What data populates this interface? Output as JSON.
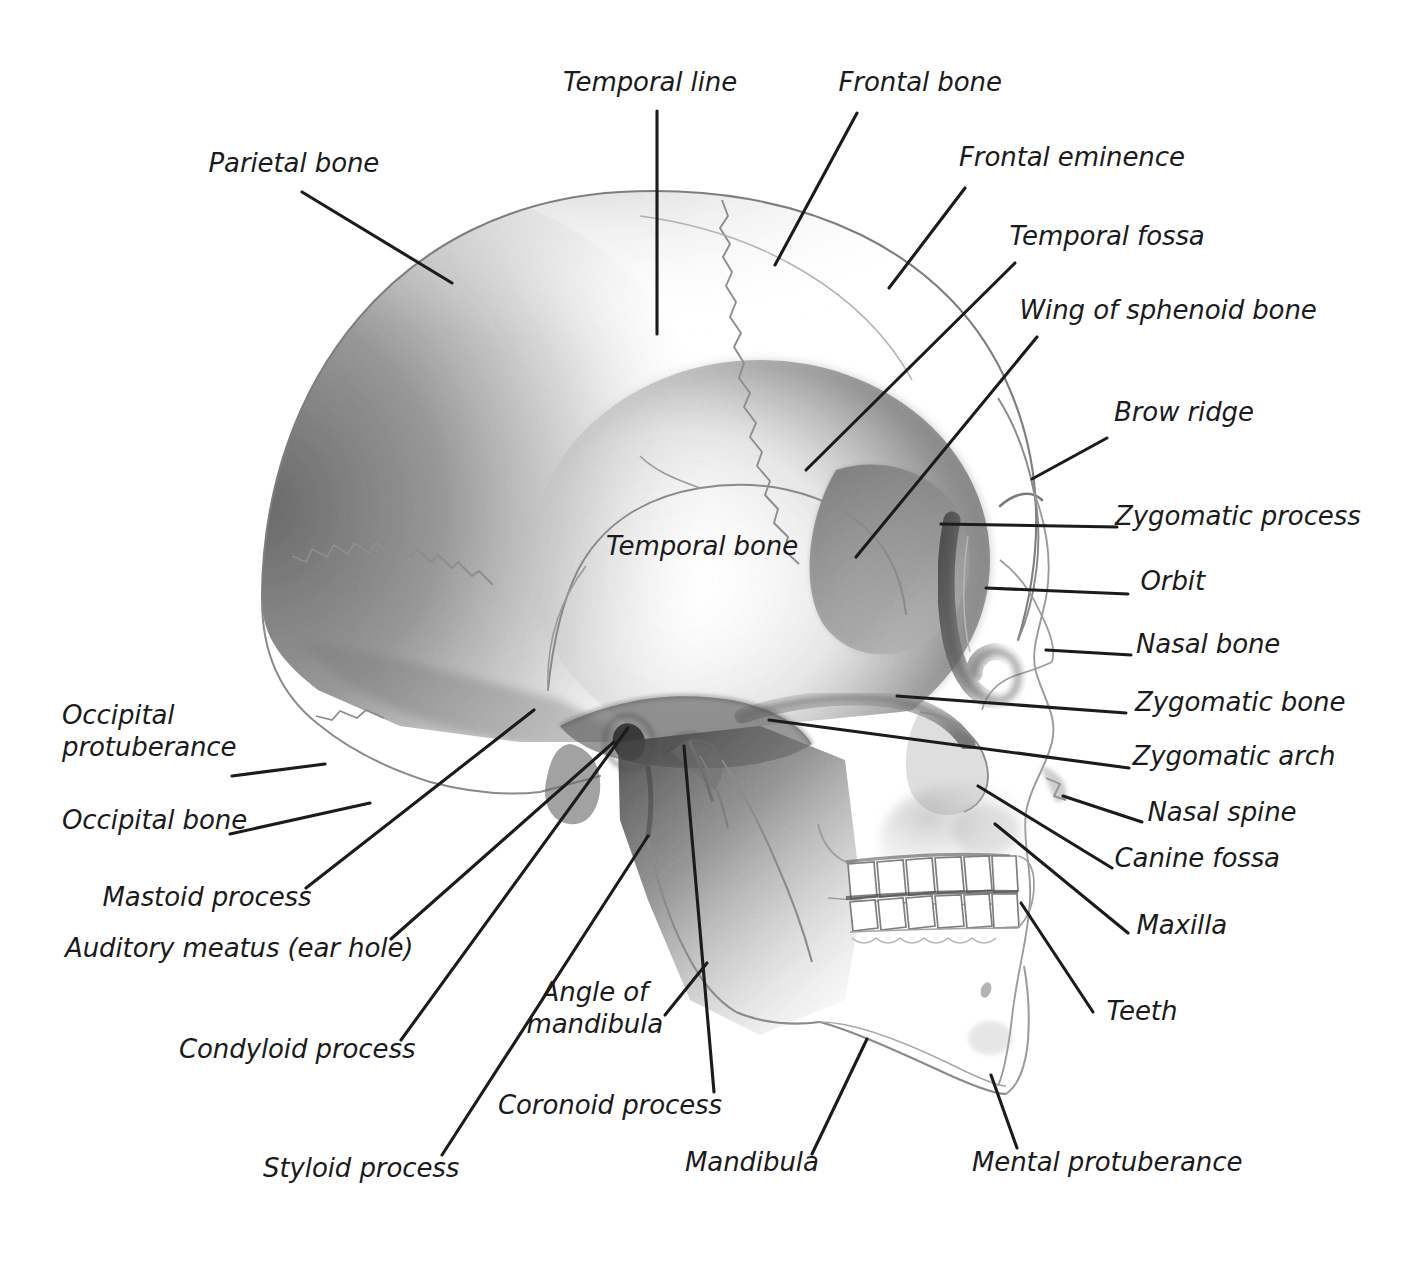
{
  "figure": {
    "type": "labeled-anatomical-diagram",
    "background_color": "#ffffff",
    "ink_color": "#1b1b1b",
    "pencil_color": "#6e6e6e"
  },
  "labels": [
    {
      "id": "temporal-line",
      "text": "Temporal line",
      "x": 650,
      "y": 82,
      "align": "center"
    },
    {
      "id": "frontal-bone",
      "text": "Frontal bone",
      "x": 920,
      "y": 82,
      "align": "center"
    },
    {
      "id": "parietal-bone",
      "text": "Parietal bone",
      "x": 294,
      "y": 163,
      "align": "center"
    },
    {
      "id": "frontal-eminence",
      "text": "Frontal eminence",
      "x": 1072,
      "y": 157,
      "align": "center"
    },
    {
      "id": "temporal-fossa",
      "text": "Temporal fossa",
      "x": 1107,
      "y": 236,
      "align": "center"
    },
    {
      "id": "wing-of-sphenoid",
      "text": "Wing of sphenoid bone",
      "x": 1168,
      "y": 310,
      "align": "center"
    },
    {
      "id": "brow-ridge",
      "text": "Brow ridge",
      "x": 1184,
      "y": 412,
      "align": "center"
    },
    {
      "id": "zygomatic-process",
      "text": "Zygomatic process",
      "x": 1238,
      "y": 516,
      "align": "center"
    },
    {
      "id": "temporal-bone",
      "text": "Temporal bone",
      "x": 702,
      "y": 546,
      "align": "center"
    },
    {
      "id": "orbit",
      "text": "Orbit",
      "x": 1173,
      "y": 581,
      "align": "center"
    },
    {
      "id": "nasal-bone",
      "text": "Nasal bone",
      "x": 1208,
      "y": 644,
      "align": "center"
    },
    {
      "id": "zygomatic-bone",
      "text": "Zygomatic bone",
      "x": 1240,
      "y": 702,
      "align": "center"
    },
    {
      "id": "zygomatic-arch",
      "text": "Zygomatic arch",
      "x": 1234,
      "y": 756,
      "align": "center"
    },
    {
      "id": "nasal-spine",
      "text": "Nasal spine",
      "x": 1222,
      "y": 812,
      "align": "center"
    },
    {
      "id": "canine-fossa",
      "text": "Canine fossa",
      "x": 1197,
      "y": 858,
      "align": "center"
    },
    {
      "id": "occipital-protuberance",
      "text": "Occipital\nprotuberance",
      "x": 62,
      "y": 731,
      "align": "left"
    },
    {
      "id": "occipital-bone",
      "text": "Occipital bone",
      "x": 62,
      "y": 820,
      "align": "left"
    },
    {
      "id": "maxilla",
      "text": "Maxilla",
      "x": 1182,
      "y": 925,
      "align": "center"
    },
    {
      "id": "mastoid-process",
      "text": "Mastoid process",
      "x": 207,
      "y": 897,
      "align": "center"
    },
    {
      "id": "auditory-meatus",
      "text": "Auditory meatus (ear hole)",
      "x": 239,
      "y": 948,
      "align": "center"
    },
    {
      "id": "teeth",
      "text": "Teeth",
      "x": 1142,
      "y": 1011,
      "align": "center"
    },
    {
      "id": "condyloid-process",
      "text": "Condyloid process",
      "x": 297,
      "y": 1049,
      "align": "center"
    },
    {
      "id": "angle-of-mandibula",
      "text": "Angle of\nmandibula",
      "x": 595,
      "y": 1008,
      "align": "center"
    },
    {
      "id": "coronoid-process",
      "text": "Coronoid process",
      "x": 610,
      "y": 1105,
      "align": "center"
    },
    {
      "id": "mandibula",
      "text": "Mandibula",
      "x": 752,
      "y": 1162,
      "align": "center"
    },
    {
      "id": "mental-protuberance",
      "text": "Mental protuberance",
      "x": 1107,
      "y": 1162,
      "align": "center"
    },
    {
      "id": "styloid-process",
      "text": "Styloid process",
      "x": 361,
      "y": 1168,
      "align": "center"
    }
  ],
  "leader_lines": [
    {
      "id": "leader-temporal-line",
      "x1": 657,
      "y1": 111,
      "x2": 657,
      "y2": 334
    },
    {
      "id": "leader-frontal-bone",
      "x1": 857,
      "y1": 113,
      "x2": 775,
      "y2": 265
    },
    {
      "id": "leader-parietal-bone",
      "x1": 302,
      "y1": 192,
      "x2": 452,
      "y2": 283
    },
    {
      "id": "leader-frontal-eminence",
      "x1": 965,
      "y1": 188,
      "x2": 889,
      "y2": 288
    },
    {
      "id": "leader-temporal-fossa",
      "x1": 1015,
      "y1": 263,
      "x2": 806,
      "y2": 470
    },
    {
      "id": "leader-wing-sphenoid",
      "x1": 1037,
      "y1": 337,
      "x2": 856,
      "y2": 557
    },
    {
      "id": "leader-brow-ridge",
      "x1": 1107,
      "y1": 438,
      "x2": 1032,
      "y2": 479
    },
    {
      "id": "leader-zygomatic-process",
      "x1": 1117,
      "y1": 527,
      "x2": 941,
      "y2": 524
    },
    {
      "id": "leader-orbit",
      "x1": 1128,
      "y1": 594,
      "x2": 986,
      "y2": 588
    },
    {
      "id": "leader-nasal-bone",
      "x1": 1131,
      "y1": 655,
      "x2": 1046,
      "y2": 650
    },
    {
      "id": "leader-zygomatic-bone",
      "x1": 1126,
      "y1": 713,
      "x2": 897,
      "y2": 696
    },
    {
      "id": "leader-zygomatic-arch",
      "x1": 1129,
      "y1": 768,
      "x2": 769,
      "y2": 720
    },
    {
      "id": "leader-nasal-spine",
      "x1": 1142,
      "y1": 822,
      "x2": 1063,
      "y2": 796
    },
    {
      "id": "leader-canine-fossa",
      "x1": 1112,
      "y1": 868,
      "x2": 978,
      "y2": 786
    },
    {
      "id": "leader-occipital-protub",
      "x1": 232,
      "y1": 776,
      "x2": 325,
      "y2": 764
    },
    {
      "id": "leader-occipital-bone",
      "x1": 230,
      "y1": 834,
      "x2": 370,
      "y2": 803
    },
    {
      "id": "leader-maxilla",
      "x1": 1128,
      "y1": 933,
      "x2": 995,
      "y2": 824
    },
    {
      "id": "leader-mastoid-process",
      "x1": 306,
      "y1": 888,
      "x2": 534,
      "y2": 710
    },
    {
      "id": "leader-auditory-meatus",
      "x1": 391,
      "y1": 939,
      "x2": 614,
      "y2": 742
    },
    {
      "id": "leader-teeth",
      "x1": 1093,
      "y1": 1012,
      "x2": 1021,
      "y2": 903
    },
    {
      "id": "leader-condyloid-process",
      "x1": 401,
      "y1": 1040,
      "x2": 628,
      "y2": 728
    },
    {
      "id": "leader-angle-mandibula",
      "x1": 665,
      "y1": 1015,
      "x2": 707,
      "y2": 963
    },
    {
      "id": "leader-coronoid-process",
      "x1": 714,
      "y1": 1092,
      "x2": 684,
      "y2": 746
    },
    {
      "id": "leader-mandibula",
      "x1": 812,
      "y1": 1154,
      "x2": 867,
      "y2": 1039
    },
    {
      "id": "leader-mental-protuberance",
      "x1": 1017,
      "y1": 1148,
      "x2": 991,
      "y2": 1075
    },
    {
      "id": "leader-styloid-process",
      "x1": 442,
      "y1": 1155,
      "x2": 648,
      "y2": 836
    }
  ]
}
